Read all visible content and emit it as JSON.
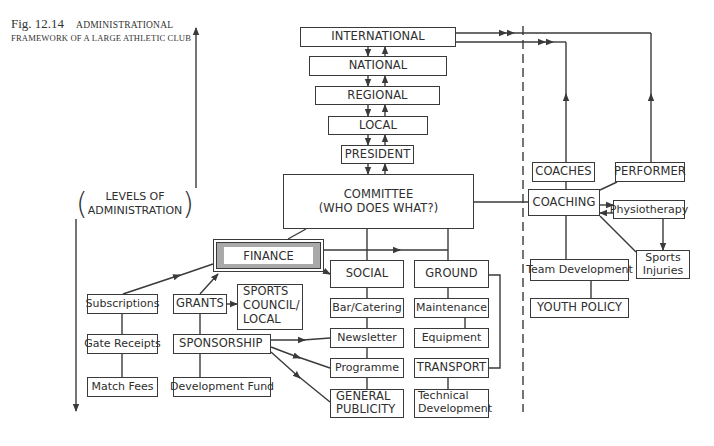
{
  "caption": {
    "figure_number": "Fig. 12.14",
    "title_line1": "Administrational",
    "title_line2": "FRAMEWORK OF A LARGE ATHLETIC CLUB"
  },
  "axis_label": {
    "line1": "LEVELS OF",
    "line2": "ADMINISTRATION"
  },
  "hierarchy": {
    "international": "INTERNATIONAL",
    "national": "NATIONAL",
    "regional": "REGIONAL",
    "local": "LOCAL",
    "president": "PRESIDENT",
    "committee_line1": "COMMITTEE",
    "committee_line2": "(WHO DOES WHAT?)"
  },
  "finance": {
    "label": "FINANCE",
    "sources": {
      "subscriptions": "Subscriptions",
      "gate_receipts": "Gate Receipts",
      "match_fees": "Match Fees",
      "grants": "GRANTS",
      "sports_council_line1": "SPORTS",
      "sports_council_line2": "COUNCIL/",
      "sports_council_line3": "LOCAL",
      "sponsorship": "SPONSORSHIP",
      "development_fund": "Development Fund"
    }
  },
  "social": {
    "label": "SOCIAL",
    "items": {
      "bar_catering": "Bar/Catering",
      "newsletter": "Newsletter",
      "programme": "Programme",
      "general_publicity_line1": "GENERAL",
      "general_publicity_line2": "PUBLICITY"
    }
  },
  "ground": {
    "label": "GROUND",
    "items": {
      "maintenance": "Maintenance",
      "equipment": "Equipment",
      "transport": "TRANSPORT",
      "technical_development_line1": "Technical",
      "technical_development_line2": "Development"
    }
  },
  "coaching_side": {
    "coaches": "COACHES",
    "performer": "PERFORMER",
    "coaching": "COACHING",
    "physiotherapy": "Physiotherapy",
    "sports_injuries_line1": "Sports",
    "sports_injuries_line2": "Injuries",
    "team_development": "Team Development",
    "youth_policy": "YOUTH POLICY"
  },
  "colors": {
    "line": "#3a3a3a",
    "finance_frame_fill": "#a9a9a9",
    "background": "#ffffff"
  }
}
